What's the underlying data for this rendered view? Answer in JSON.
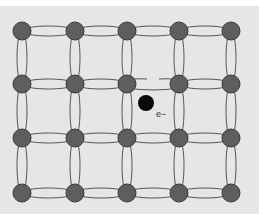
{
  "diagram": {
    "rows": 4,
    "cols": 5,
    "broken_bond": {
      "from": [
        1,
        2
      ],
      "to": [
        1,
        3
      ]
    },
    "free_electron_label": "e−",
    "colors": {
      "background": "#e6e6e6",
      "atom_fill": "#5e5e5e",
      "atom_stroke": "#3a3a3a",
      "bond_stroke": "#555555",
      "electron_fill": "#0a0a0a",
      "label_color": "#333333"
    }
  }
}
